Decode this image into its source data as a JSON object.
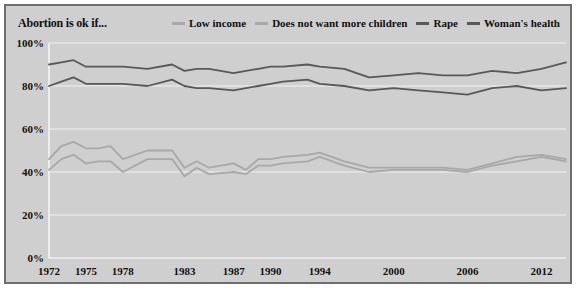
{
  "title": "Abortion is ok if...",
  "colors": {
    "background": "#cfcfcf",
    "border": "#6e6e6e",
    "dark_line": "#585858",
    "light_line": "#a8a8a8",
    "grid": "#f2f2f2"
  },
  "legend": {
    "items": [
      {
        "label": "Low income",
        "color": "#a8a8a8"
      },
      {
        "label": "Does not want more children",
        "color": "#a8a8a8"
      },
      {
        "label": "Rape",
        "color": "#585858"
      },
      {
        "label": "Woman's health",
        "color": "#585858"
      }
    ]
  },
  "chart_data": {
    "type": "line",
    "title": "Abortion is ok if...",
    "xlabel": "",
    "ylabel": "",
    "ylim": [
      0,
      100
    ],
    "ytick_labels": [
      "0%",
      "20%",
      "40%",
      "60%",
      "80%",
      "100%"
    ],
    "ytick_values": [
      0,
      20,
      40,
      60,
      80,
      100
    ],
    "grid": true,
    "legend_position": "top-right",
    "x": [
      1972,
      1973,
      1974,
      1975,
      1976,
      1977,
      1978,
      1980,
      1982,
      1983,
      1984,
      1985,
      1987,
      1988,
      1989,
      1990,
      1991,
      1993,
      1994,
      1996,
      1998,
      2000,
      2002,
      2004,
      2006,
      2008,
      2010,
      2012,
      2014
    ],
    "xtick_labels": [
      "1972",
      "1975",
      "1978",
      "1983",
      "1987",
      "1990",
      "1994",
      "2000",
      "2006",
      "2012"
    ],
    "xtick_values": [
      1972,
      1975,
      1978,
      1983,
      1987,
      1990,
      1994,
      2000,
      2006,
      2012
    ],
    "series": [
      {
        "name": "Woman's health",
        "color": "#585858",
        "values": [
          90,
          91,
          92,
          89,
          89,
          89,
          89,
          88,
          90,
          87,
          88,
          88,
          86,
          87,
          88,
          89,
          89,
          90,
          89,
          88,
          84,
          85,
          86,
          85,
          85,
          87,
          86,
          88,
          91
        ]
      },
      {
        "name": "Rape",
        "color": "#585858",
        "values": [
          80,
          82,
          84,
          81,
          81,
          81,
          81,
          80,
          83,
          80,
          79,
          79,
          78,
          79,
          80,
          81,
          82,
          83,
          81,
          80,
          78,
          79,
          78,
          77,
          76,
          79,
          80,
          78,
          79
        ]
      },
      {
        "name": "Low income",
        "color": "#a8a8a8",
        "values": [
          46,
          52,
          54,
          51,
          51,
          52,
          46,
          50,
          50,
          42,
          45,
          42,
          44,
          41,
          46,
          46,
          47,
          48,
          49,
          45,
          42,
          42,
          42,
          42,
          41,
          44,
          47,
          48,
          46
        ]
      },
      {
        "name": "Does not want more children",
        "color": "#a8a8a8",
        "values": [
          41,
          46,
          48,
          44,
          45,
          45,
          40,
          46,
          46,
          38,
          42,
          39,
          40,
          39,
          43,
          43,
          44,
          45,
          47,
          43,
          40,
          41,
          41,
          41,
          40,
          43,
          45,
          47,
          45
        ]
      }
    ]
  }
}
